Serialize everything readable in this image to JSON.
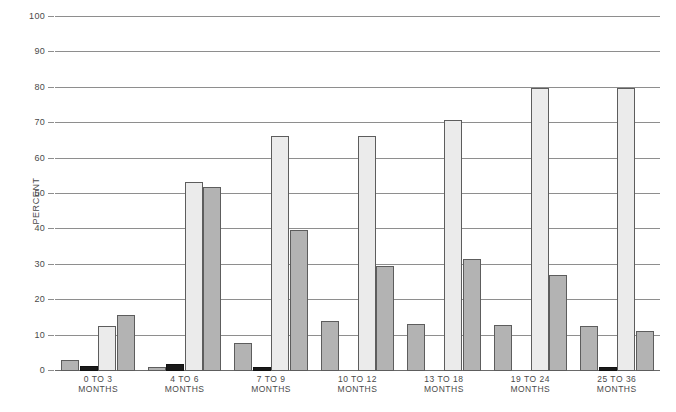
{
  "chart_data": {
    "type": "bar",
    "title": "",
    "xlabel": "",
    "ylabel": "PERCENT",
    "ylim": [
      0,
      100
    ],
    "yticks": [
      0,
      10,
      20,
      30,
      40,
      50,
      60,
      70,
      80,
      90,
      100
    ],
    "ytick_labels": [
      "0",
      "10",
      "20",
      "30",
      "40",
      "50",
      "60",
      "70",
      "80",
      "90",
      "100"
    ],
    "grid": true,
    "legend": "none",
    "categories": [
      "0 TO 3 MONTHS",
      "4 TO 6 MONTHS",
      "7 TO 9 MONTHS",
      "10 TO 12 MONTHS",
      "13 TO 18 MONTHS",
      "19 TO 24 MONTHS",
      "25 TO 36 MONTHS"
    ],
    "category_lines": [
      [
        "0 TO 3",
        "MONTHS"
      ],
      [
        "4 TO 6",
        "MONTHS"
      ],
      [
        "7 TO 9",
        "MONTHS"
      ],
      [
        "10 TO 12",
        "MONTHS"
      ],
      [
        "13 TO 18",
        "MONTHS"
      ],
      [
        "19 TO 24",
        "MONTHS"
      ],
      [
        "25 TO 36",
        "MONTHS"
      ]
    ],
    "series": [
      {
        "name": "series-1",
        "shade": "medium",
        "color": "#b3b3b3",
        "values": [
          3.0,
          1.2,
          8.0,
          14.2,
          13.2,
          13.0,
          12.7
        ]
      },
      {
        "name": "series-2",
        "shade": "dark",
        "color": "#1a1a1a",
        "values": [
          1.3,
          2.0,
          1.0,
          0.0,
          0.0,
          0.0,
          1.2
        ]
      },
      {
        "name": "series-3",
        "shade": "light",
        "color": "#ebebeb",
        "values": [
          12.6,
          53.5,
          66.3,
          66.5,
          70.9,
          80.0,
          80.0
        ]
      },
      {
        "name": "series-4",
        "shade": "medium",
        "color": "#b3b3b3",
        "values": [
          15.9,
          51.9,
          39.7,
          29.6,
          31.6,
          27.1,
          11.2
        ]
      }
    ]
  },
  "style": {
    "gridline_color": "#8e8e8e",
    "bar_border_color": "#5d5d5d",
    "text_color": "#4a4a4a",
    "background": "#ffffff"
  }
}
